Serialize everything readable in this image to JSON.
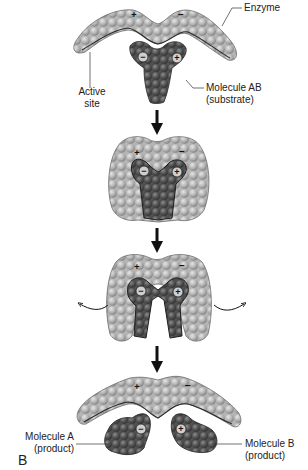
{
  "figure": {
    "panel_label": "B",
    "stages": [
      {
        "index": 1,
        "description": "Enzyme and substrate separated",
        "labels": {
          "enzyme": "Enzyme",
          "active_site_line1": "Active",
          "active_site_line2": "site",
          "substrate_line1": "Molecule AB",
          "substrate_line2": "(substrate)"
        },
        "charges": {
          "enzyme_left": "+",
          "enzyme_right": "−",
          "substrate_left": "−",
          "substrate_right": "+"
        }
      },
      {
        "index": 2,
        "description": "Substrate binds to active site (enzyme-substrate complex)",
        "charges": {
          "enzyme_left": "+",
          "enzyme_right": "−",
          "substrate_left": "−",
          "substrate_right": "+"
        }
      },
      {
        "index": 3,
        "description": "Enzyme changes shape, straining substrate bonds",
        "charges": {
          "enzyme_left": "+",
          "enzyme_right": "−",
          "substrate_left": "−",
          "substrate_right": "+"
        }
      },
      {
        "index": 4,
        "description": "Products released; enzyme returns to original shape",
        "labels": {
          "product_a_line1": "Molecule A",
          "product_a_line2": "(product)",
          "product_b_line1": "Molecule B",
          "product_b_line2": "(product)"
        },
        "charges": {
          "enzyme_left": "+",
          "enzyme_right": "−",
          "product_a": "−",
          "product_b": "+"
        }
      }
    ],
    "colors": {
      "enzyme": "#b8b8b8",
      "enzyme_shade": "#8a8a8a",
      "substrate": "#5a5a5a",
      "substrate_shade": "#3a3a3a",
      "arrow": "#111111",
      "leader_line": "#333333"
    }
  }
}
